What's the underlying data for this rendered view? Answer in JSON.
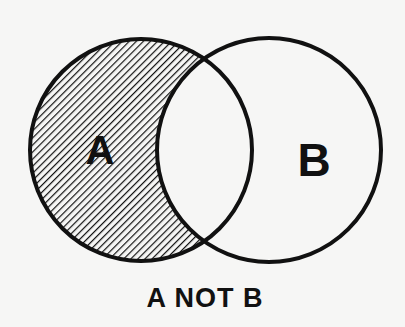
{
  "diagram": {
    "type": "venn",
    "caption": "A NOT B",
    "operation": "A NOT B",
    "sets": [
      {
        "id": "A",
        "label": "A",
        "shaded": true,
        "shading": "diagonal-hatch"
      },
      {
        "id": "B",
        "label": "B",
        "shaded": false
      }
    ],
    "shaded_region": "A minus B (part of A outside B)",
    "colors": {
      "outline": "#111111",
      "hatch": "#111111",
      "background": "#f6f6f5"
    }
  }
}
